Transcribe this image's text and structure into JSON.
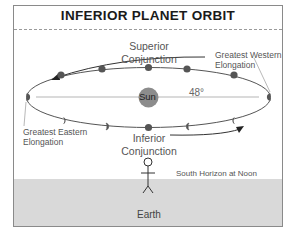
{
  "diagram": {
    "title": "INFERIOR PLANET ORBIT",
    "labels": {
      "superior_conjunction_line1": "Superior",
      "superior_conjunction_line2": "Conjunction",
      "inferior_conjunction_line1": "Inferior",
      "inferior_conjunction_line2": "Conjunction",
      "greatest_western_line1": "Greatest Western",
      "greatest_western_line2": "Elongation",
      "greatest_eastern_line1": "Greatest Eastern",
      "greatest_eastern_line2": "Elongation",
      "sun": "Sun",
      "angle": "48°",
      "horizon": "South Horizon at Noon",
      "earth": "Earth"
    },
    "colors": {
      "planet": "#555555",
      "sun": "#8c8c8c",
      "orbit": "#555555",
      "earth_ground": "#d9d9d9",
      "border": "#8a8a8a"
    }
  }
}
